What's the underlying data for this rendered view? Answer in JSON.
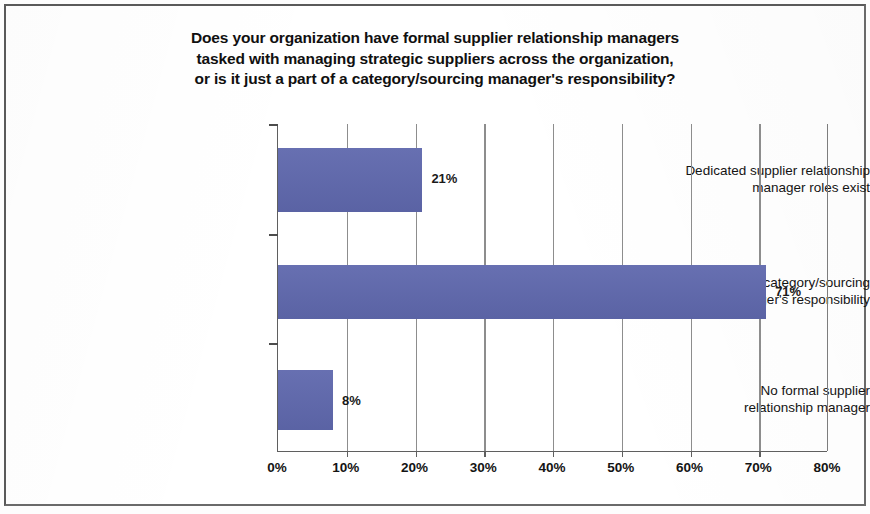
{
  "chart_data": {
    "type": "bar",
    "orientation": "horizontal",
    "title_lines": [
      "Does your organization have formal supplier relationship managers",
      "tasked with managing strategic suppliers across the organization,",
      "or is it just a part of a category/sourcing manager's responsibility?"
    ],
    "categories": [
      "Dedicated supplier relationship manager roles exist",
      "Part of category/sourcing manager's responsibility",
      "No formal supplier relationship manager"
    ],
    "category_lines": [
      [
        "Dedicated supplier relationship",
        "manager roles exist"
      ],
      [
        "Part of category/sourcing",
        "manager's responsibility"
      ],
      [
        "No formal supplier",
        "relationship manager"
      ]
    ],
    "values": [
      21,
      71,
      8
    ],
    "value_labels": [
      "21%",
      "71%",
      "8%"
    ],
    "xlabel": "",
    "ylabel": "",
    "xlim": [
      0,
      80
    ],
    "xticks": [
      0,
      10,
      20,
      30,
      40,
      50,
      60,
      70,
      80
    ],
    "xtick_labels": [
      "0%",
      "10%",
      "20%",
      "30%",
      "40%",
      "50%",
      "60%",
      "70%",
      "80%"
    ],
    "grid": "vertical",
    "legend": null,
    "bar_color": "#5F68AD",
    "axis_color": "#5F5F5F",
    "grid_color": "#8D8D8D",
    "text_color": "#141414",
    "background_color": "#FFFFFF"
  }
}
